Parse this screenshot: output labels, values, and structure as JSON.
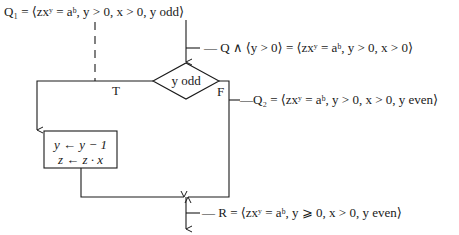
{
  "diagram": {
    "type": "flowchart",
    "assertions": {
      "q1": "Q₁ = ⟨zxʸ = aᵇ, y > 0, x > 0, y odd⟩",
      "q_and": "— Q ∧ ⟨y > 0⟩ = ⟨zxʸ = aᵇ, y > 0, x > 0⟩",
      "q2": "—Q₂ = ⟨zxʸ = aᵇ, y > 0, x > 0, y even⟩",
      "r": "— R = ⟨zxʸ = aᵇ, y ⩾ 0, x > 0, y even⟩"
    },
    "decision": {
      "condition": "y odd",
      "true_label": "T",
      "false_label": "F"
    },
    "process_box": {
      "line1": "y ← y − 1",
      "line2": "z ← z · x"
    }
  }
}
